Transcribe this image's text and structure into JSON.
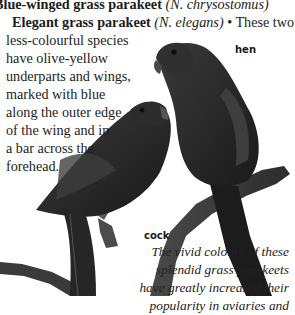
{
  "header": {
    "species_1": {
      "name": "Blue-winged grass parakeet",
      "latin": "(N. chrysostomus)"
    },
    "species_2": {
      "name": "Elegant grass parakeet",
      "latin": "(N. elegans)",
      "bullet": "•",
      "text_start": "These two"
    }
  },
  "body_lines": [
    "less-colourful species",
    "have olive-yellow",
    "underparts and wings,",
    "marked with blue",
    "along the outer edge",
    "of the wing and in",
    "a bar across the",
    "forehead."
  ],
  "labels": {
    "hen": "hen",
    "cock": "cock"
  },
  "caption_lines": [
    "The vivid colours of these",
    "splendid grass parakeets",
    "have greatly increased their",
    "popularity in aviaries and"
  ],
  "illustration": {
    "subject": "two grass parakeets perched on a branch",
    "icons": [
      "hen-parakeet-icon",
      "cock-parakeet-icon",
      "branch-icon"
    ]
  }
}
